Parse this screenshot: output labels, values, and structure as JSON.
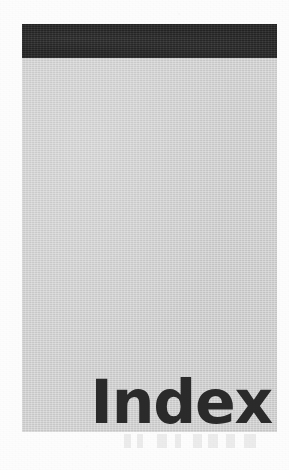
{
  "page": {
    "background_color": "#fdfdfd",
    "width": 289,
    "height": 470
  },
  "panel": {
    "name": "grey-tab-panel",
    "fill_color": "#d2d2d2",
    "left": 22,
    "top": 24,
    "width": 255,
    "height": 408
  },
  "header_band": {
    "name": "black-header-band",
    "fill_color": "#2a2a2a",
    "left": 22,
    "top": 24,
    "width": 255,
    "height": 34
  },
  "title": {
    "text": "Index",
    "color": "#2b2b2b",
    "align": "right",
    "font_size_px": 60,
    "weight": "bold"
  },
  "artifacts": {
    "bleed_through_label": "reverse-side show-through",
    "grain_label": "scanned paper grain"
  }
}
